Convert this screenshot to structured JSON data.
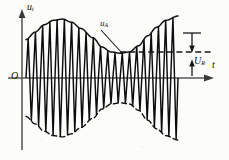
{
  "figure": {
    "background_color": "#fcfcfb",
    "ink_color": "#121212",
    "axis_color": "#4a4a4a"
  },
  "labels": {
    "y_axis": "u",
    "y_axis_sub": "t",
    "envelope": "u",
    "envelope_sub": "A",
    "amplitude": "U",
    "amplitude_sub": "R",
    "x_axis": "t",
    "origin": "O"
  },
  "chart_data": {
    "type": "line",
    "xlabel": "t",
    "ylabel": "u_t",
    "grid": false,
    "legend": null,
    "axes": {
      "x_origin_px": 22,
      "y_origin_px": 78,
      "x_end_px": 214,
      "y_top_px": 12,
      "y_bottom_px": 150,
      "x_range_units": [
        0,
        1
      ],
      "y_range_units": [
        -1.15,
        1.15
      ]
    },
    "carrier": {
      "description": "high-frequency triangular carrier oscillation",
      "cycles": 21,
      "x_start_px": 26,
      "x_end_px": 178,
      "waveform": "triangle"
    },
    "envelope": {
      "description": "modulating envelope; maxima at both ends, minimum at centre",
      "style_top": "solid",
      "style_bottom": "dashed",
      "normalized_points": [
        {
          "x": 0.0,
          "amp": 0.62
        },
        {
          "x": 0.06,
          "amp": 0.74
        },
        {
          "x": 0.12,
          "amp": 0.86
        },
        {
          "x": 0.18,
          "amp": 0.93
        },
        {
          "x": 0.24,
          "amp": 0.95
        },
        {
          "x": 0.3,
          "amp": 0.9
        },
        {
          "x": 0.36,
          "amp": 0.8
        },
        {
          "x": 0.44,
          "amp": 0.65
        },
        {
          "x": 0.5,
          "amp": 0.5
        },
        {
          "x": 0.56,
          "amp": 0.42
        },
        {
          "x": 0.62,
          "amp": 0.4
        },
        {
          "x": 0.68,
          "amp": 0.42
        },
        {
          "x": 0.74,
          "amp": 0.52
        },
        {
          "x": 0.8,
          "amp": 0.68
        },
        {
          "x": 0.86,
          "amp": 0.82
        },
        {
          "x": 0.92,
          "amp": 0.93
        },
        {
          "x": 1.0,
          "amp": 1.0
        }
      ]
    },
    "amplitude_marker": {
      "label": "U_R",
      "dashed_reference_line_y_px": 52,
      "arrow_top_y_px": 33,
      "arrow_bottom_y_px": 78,
      "marker_x_px": 192,
      "dashed_line_x_start_px": 120,
      "dashed_line_x_end_px": 212
    },
    "leader_line": {
      "from_label": "u_A",
      "start_px": [
        101,
        30
      ],
      "end_px": [
        122,
        53
      ]
    }
  }
}
